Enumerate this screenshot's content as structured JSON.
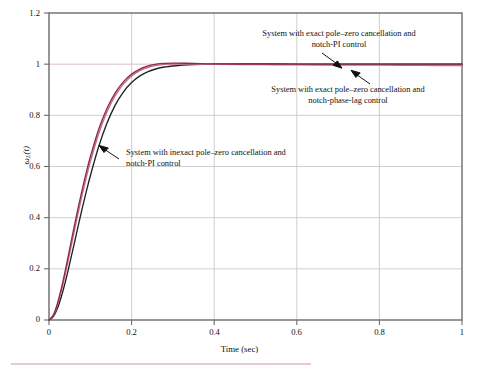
{
  "chart_data": {
    "type": "line",
    "title": "",
    "xlabel": "Time (sec)",
    "ylabel": "ωL(t)",
    "xlim": [
      0,
      1
    ],
    "ylim": [
      0,
      1.2
    ],
    "xticks": [
      "0",
      "0.2",
      "0.4",
      "0.6",
      "0.8",
      "1"
    ],
    "xtick_values": [
      0,
      0.2,
      0.4,
      0.6,
      0.8,
      1
    ],
    "yticks": [
      "0",
      "0.2",
      "0.4",
      "0.6",
      "0.8",
      "1",
      "1.2"
    ],
    "ytick_values": [
      0,
      0.2,
      0.4,
      0.6,
      0.8,
      1,
      1.2
    ],
    "grid": true,
    "legend": "annotations",
    "x": [
      0,
      0.01,
      0.02,
      0.03,
      0.04,
      0.05,
      0.06,
      0.07,
      0.08,
      0.09,
      0.1,
      0.12,
      0.14,
      0.16,
      0.18,
      0.2,
      0.22,
      0.24,
      0.26,
      0.28,
      0.3,
      0.35,
      0.4,
      0.5,
      0.6,
      0.7,
      0.8,
      0.9,
      1.0
    ],
    "series": [
      {
        "name": "System with exact pole-zero cancellation and notch-PI control",
        "color": "#8e2a44",
        "values": [
          0,
          0.018,
          0.062,
          0.124,
          0.198,
          0.277,
          0.357,
          0.434,
          0.507,
          0.575,
          0.637,
          0.744,
          0.826,
          0.887,
          0.931,
          0.961,
          0.981,
          0.993,
          1.0,
          1.003,
          1.004,
          1.003,
          1.001,
          1.0,
          1.0,
          1.0,
          1.0,
          1.0,
          1.0
        ]
      },
      {
        "name": "System with exact pole-zero cancellation and notch-phase-lag control",
        "color": "#c06a8e",
        "values": [
          0,
          0.016,
          0.056,
          0.114,
          0.184,
          0.26,
          0.338,
          0.414,
          0.487,
          0.555,
          0.618,
          0.727,
          0.812,
          0.876,
          0.922,
          0.954,
          0.975,
          0.988,
          0.995,
          0.999,
          1.0,
          1.0,
          0.999,
          0.998,
          0.997,
          0.996,
          0.996,
          0.995,
          0.995
        ]
      },
      {
        "name": "System with inexact pole-zero cancellation and notch-PI control",
        "color": "#1c2420",
        "values": [
          0,
          0.012,
          0.044,
          0.092,
          0.152,
          0.22,
          0.291,
          0.363,
          0.433,
          0.5,
          0.563,
          0.676,
          0.768,
          0.839,
          0.891,
          0.928,
          0.954,
          0.971,
          0.982,
          0.989,
          0.993,
          0.998,
          1.0,
          1.001,
          1.0,
          1.0,
          1.0,
          1.0,
          1.0
        ]
      }
    ],
    "annotations": [
      {
        "id": "exact-pi",
        "line1": "System with exact pole–zero cancellation and",
        "line2": "notch-PI control"
      },
      {
        "id": "exact-lag",
        "line1": "System with exact pole–zero cancellation and",
        "line2": "notch-phase-lag control"
      },
      {
        "id": "inexact-pi",
        "line1": "System with inexact pole–zero cancellation and",
        "line2": "notch-PI control"
      }
    ]
  },
  "axes": {
    "x_title": "Time (sec)",
    "x_tick_0": "0",
    "x_tick_1": "0.2",
    "x_tick_2": "0.4",
    "x_tick_3": "0.6",
    "x_tick_4": "0.8",
    "x_tick_5": "1",
    "y_tick_0": "0",
    "y_tick_1": "0.2",
    "y_tick_2": "0.4",
    "y_tick_3": "0.6",
    "y_tick_4": "0.8",
    "y_tick_5": "1",
    "y_tick_6": "1.2",
    "y_title_main": "ω",
    "y_title_sub": "L",
    "y_title_arg": "(t)"
  },
  "colors": {
    "curve_exact_pi": "#8e2a44",
    "curve_exact_lag": "#c06a8e",
    "curve_inexact_pi": "#1c2420",
    "grid": "#c9c9c9",
    "axis": "#6b6b6b",
    "bottom_rule": "#e9c9d2",
    "background": "#ffffff"
  }
}
